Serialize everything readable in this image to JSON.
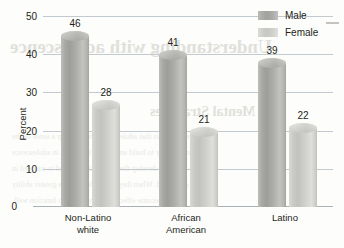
{
  "chart_data": {
    "type": "bar",
    "title": "",
    "xlabel": "",
    "ylabel": "Percent",
    "ylim": [
      0,
      50
    ],
    "yticks": [
      0,
      10,
      20,
      30,
      40,
      50
    ],
    "grid": true,
    "legend_position": "top-right",
    "categories": [
      "Non-Latino\nwhite",
      "African\nAmerican",
      "Latino"
    ],
    "series": [
      {
        "name": "Male",
        "values": [
          46,
          41,
          39
        ],
        "color": "#a8a8a4"
      },
      {
        "name": "Female",
        "values": [
          28,
          21,
          22
        ],
        "color": "#cdcdca"
      }
    ]
  },
  "legend": {
    "items": [
      {
        "label": "Male"
      },
      {
        "label": "Female"
      }
    ]
  },
  "axis": {
    "y_label": "Percent",
    "y_ticks": [
      "50",
      "40",
      "30",
      "20",
      "10",
      "0"
    ]
  },
  "bleed_through": {
    "heading": "Understanding with adolescence",
    "subheading": "Mental Strategies",
    "lines": [
      "research shows that adolescents who develop a sense of the",
      "more likely to build and keep friendships in adolescence",
      "and to develop the social skills needed to succeed in",
      "adulthood. When they study, they have a greater ability",
      "to become effective learners and to function well."
    ]
  }
}
